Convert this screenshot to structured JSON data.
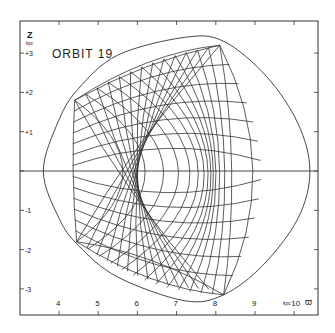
{
  "chart_data": {
    "type": "line",
    "title": "ORBIT 19",
    "xlabel": "ϖ",
    "xunit": "kpc",
    "ylabel": "Z",
    "yunit": "kpc",
    "xlim": [
      3.0,
      10.6
    ],
    "ylim": [
      -3.7,
      3.8
    ],
    "xticks": [
      4,
      5,
      6,
      7,
      8,
      9,
      10
    ],
    "xtick_labels": [
      "4",
      "5",
      "6",
      "7",
      "8",
      "9",
      "10"
    ],
    "yticks": [
      3,
      2,
      1,
      0,
      -1,
      -2,
      -3
    ],
    "ytick_labels": [
      "+3",
      "+2",
      "+1",
      "",
      "-1",
      "-2",
      "-3"
    ],
    "grid": false,
    "zero_line": true,
    "series": [
      {
        "name": "zero-velocity envelope",
        "kind": "closed-curve",
        "points": [
          [
            3.6,
            0
          ],
          [
            4.0,
            1.3
          ],
          [
            4.5,
            2.1
          ],
          [
            5.5,
            2.95
          ],
          [
            7.2,
            3.4
          ],
          [
            8.2,
            3.3
          ],
          [
            9.3,
            2.4
          ],
          [
            10.1,
            1.2
          ],
          [
            10.4,
            0
          ],
          [
            10.1,
            -1.2
          ],
          [
            9.2,
            -2.4
          ],
          [
            8.2,
            -3.15
          ],
          [
            7.2,
            -3.3
          ],
          [
            5.5,
            -2.7
          ],
          [
            4.5,
            -1.9
          ],
          [
            4.0,
            -1.2
          ],
          [
            3.6,
            0
          ]
        ]
      },
      {
        "name": "orbit 19 trajectory",
        "kind": "box-orbit",
        "cusps": {
          "upper_left": [
            4.4,
            1.8
          ],
          "upper_right": [
            8.1,
            3.2
          ],
          "lower_left": [
            4.45,
            -1.8
          ],
          "lower_right": [
            8.2,
            -3.15
          ]
        },
        "r_range": [
          4.35,
          9.1
        ],
        "z_range": [
          -3.15,
          3.2
        ],
        "n_loops": 14
      }
    ]
  },
  "figure": {
    "title": "ORBIT 19",
    "y_axis_symbol": "Z",
    "y_axis_unit": "kpc",
    "x_axis_unit": "kpc",
    "x_axis_symbol": "ϖ"
  }
}
